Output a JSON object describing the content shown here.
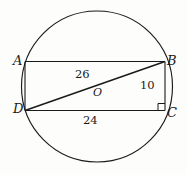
{
  "figure": {
    "kind": "geometry-diagram",
    "background_color": "#fdfdfc",
    "stroke_color": "#1a1a1a",
    "vertex_labels": {
      "a": "A",
      "b": "B",
      "c": "C",
      "d": "D"
    },
    "center_label": "O",
    "measures": {
      "diagonal_db": "26",
      "side_bc": "10",
      "side_dc": "24"
    },
    "markers": {
      "right_angle_at": "C"
    }
  },
  "geometry": {
    "circle": {
      "cx": 97,
      "cy": 86.5,
      "r": 75.5
    },
    "rectangle": {
      "a": {
        "x": 25,
        "y": 61.5
      },
      "b": {
        "x": 165,
        "y": 61.5
      },
      "c": {
        "x": 165,
        "y": 110.5
      },
      "d": {
        "x": 25,
        "y": 110.5
      }
    },
    "diagonal": {
      "from": "d",
      "to": "b"
    }
  }
}
